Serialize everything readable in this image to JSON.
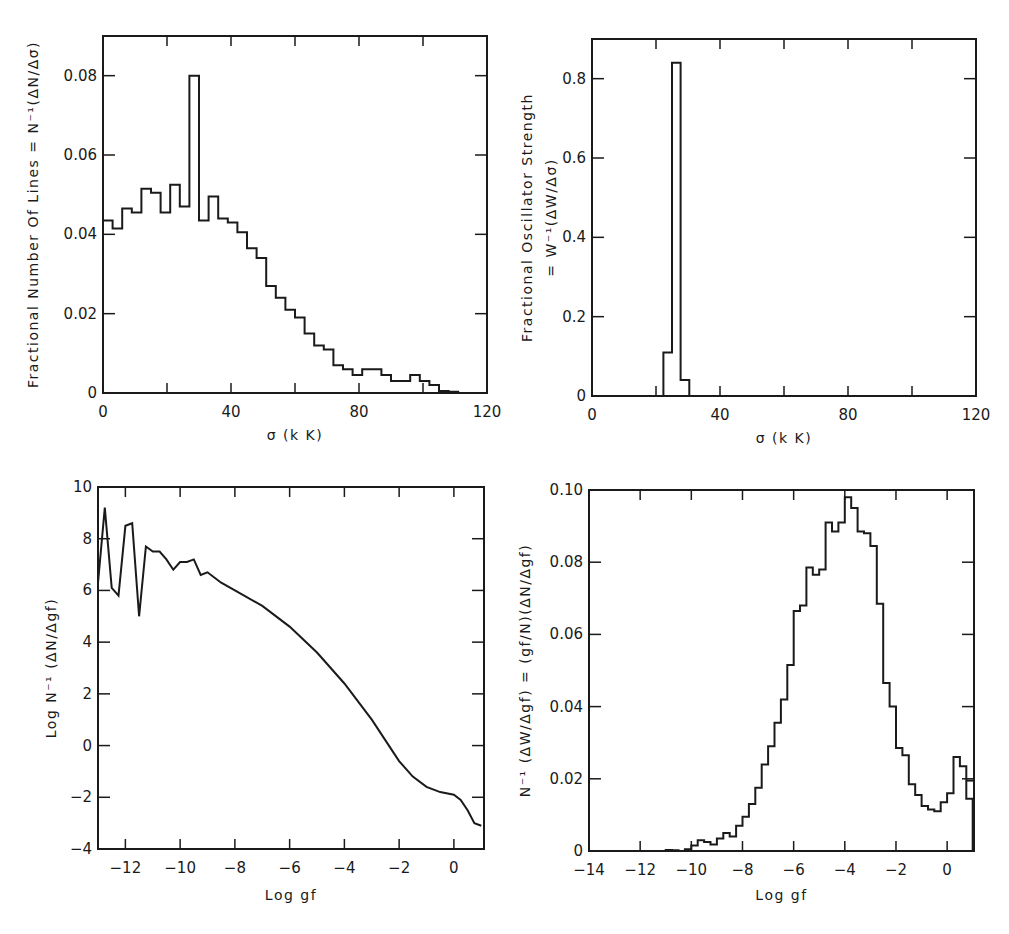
{
  "figure": {
    "panels": [
      {
        "id": "top-left",
        "xlabel": "σ (k K)",
        "ylabel": "Fractional Number Of Lines = N⁻¹(ΔN/Δσ)",
        "xticks": [
          "0",
          "40",
          "80",
          "120"
        ],
        "yticks": [
          "0",
          "0.02",
          "0.04",
          "0.06",
          "0.08"
        ]
      },
      {
        "id": "top-right",
        "xlabel": "σ (k K)",
        "ylabel_line1": "Fractional Oscillator Strength",
        "ylabel_line2": "= W⁻¹(ΔW/Δσ)",
        "xticks": [
          "0",
          "40",
          "80",
          "120"
        ],
        "yticks": [
          "0",
          "0.2",
          "0.4",
          "0.6",
          "0.8"
        ]
      },
      {
        "id": "bottom-left",
        "xlabel": "Log  gf",
        "ylabel": "Log N⁻¹ (ΔN/Δgf)",
        "xticks": [
          "-12",
          "-10",
          "-8",
          "-6",
          "-4",
          "-2",
          "0"
        ],
        "yticks": [
          "-4",
          "-2",
          "0",
          "2",
          "4",
          "6",
          "8",
          "10"
        ]
      },
      {
        "id": "bottom-right",
        "xlabel": "Log  gf",
        "ylabel": "N⁻¹ (ΔW/Δgf) = (gf/N)(ΔN/Δgf)",
        "xticks": [
          "-14",
          "-12",
          "-10",
          "-8",
          "-6",
          "-4",
          "-2",
          "0"
        ],
        "yticks": [
          "0",
          "0.02",
          "0.04",
          "0.06",
          "0.08",
          "0.10"
        ]
      }
    ]
  },
  "chart_data": [
    {
      "type": "bar",
      "style": "step-histogram",
      "title": "",
      "xlabel": "σ (k K)",
      "ylabel": "Fractional Number Of Lines = N⁻¹(ΔN/Δσ)",
      "xlim": [
        0,
        120
      ],
      "ylim": [
        0,
        0.09
      ],
      "grid": false,
      "bin_width": 3,
      "x": [
        0,
        3,
        6,
        9,
        12,
        15,
        18,
        21,
        24,
        27,
        30,
        33,
        36,
        39,
        42,
        45,
        48,
        51,
        54,
        57,
        60,
        63,
        66,
        69,
        72,
        75,
        78,
        81,
        84,
        87,
        90,
        93,
        96,
        99,
        102,
        105,
        108
      ],
      "values": [
        0.0435,
        0.0415,
        0.0465,
        0.0455,
        0.0515,
        0.0505,
        0.0455,
        0.0525,
        0.047,
        0.08,
        0.0435,
        0.0495,
        0.044,
        0.043,
        0.0405,
        0.0365,
        0.034,
        0.027,
        0.024,
        0.021,
        0.019,
        0.015,
        0.012,
        0.011,
        0.007,
        0.006,
        0.0045,
        0.006,
        0.006,
        0.0045,
        0.003,
        0.003,
        0.0045,
        0.003,
        0.002,
        0.0005,
        0.0003
      ]
    },
    {
      "type": "bar",
      "style": "step-histogram",
      "title": "",
      "xlabel": "σ (k K)",
      "ylabel": "Fractional Oscillator Strength = W⁻¹(ΔW/Δσ)",
      "xlim": [
        0,
        120
      ],
      "ylim": [
        0,
        0.9
      ],
      "grid": false,
      "bin_width": 2.7,
      "x": [
        22.3,
        25.0,
        27.7
      ],
      "values": [
        0.11,
        0.84,
        0.04
      ]
    },
    {
      "type": "line",
      "title": "",
      "xlabel": "Log  gf",
      "ylabel": "Log N⁻¹ (ΔN/Δgf)",
      "xlim": [
        -13,
        1.1
      ],
      "ylim": [
        -4,
        10
      ],
      "grid": false,
      "x": [
        -13.0,
        -12.75,
        -12.5,
        -12.25,
        -12.0,
        -11.75,
        -11.5,
        -11.25,
        -11.0,
        -10.75,
        -10.5,
        -10.25,
        -10.0,
        -9.75,
        -9.5,
        -9.25,
        -9.0,
        -8.75,
        -8.5,
        -8.0,
        -7.0,
        -6.0,
        -5.0,
        -4.0,
        -3.0,
        -2.0,
        -1.5,
        -1.0,
        -0.5,
        0.0,
        0.25,
        0.5,
        0.75,
        1.0
      ],
      "values": [
        6.3,
        9.2,
        6.1,
        5.8,
        8.5,
        8.6,
        5.0,
        7.7,
        7.5,
        7.5,
        7.2,
        6.8,
        7.1,
        7.1,
        7.2,
        6.6,
        6.7,
        6.5,
        6.3,
        6.0,
        5.4,
        4.6,
        3.6,
        2.4,
        1.0,
        -0.6,
        -1.2,
        -1.6,
        -1.8,
        -1.9,
        -2.1,
        -2.5,
        -3.0,
        -3.1
      ]
    },
    {
      "type": "bar",
      "style": "step-histogram",
      "title": "",
      "xlabel": "Log  gf",
      "ylabel": "N⁻¹ (ΔW/Δgf) = (gf/N)(ΔN/Δgf)",
      "xlim": [
        -14,
        1.05
      ],
      "ylim": [
        0,
        0.1
      ],
      "grid": false,
      "bin_width": 0.25,
      "x": [
        -11.0,
        -10.75,
        -10.5,
        -10.25,
        -10.0,
        -9.75,
        -9.5,
        -9.25,
        -9.0,
        -8.75,
        -8.5,
        -8.25,
        -8.0,
        -7.75,
        -7.5,
        -7.25,
        -7.0,
        -6.75,
        -6.5,
        -6.25,
        -6.0,
        -5.75,
        -5.5,
        -5.25,
        -5.0,
        -4.75,
        -4.5,
        -4.25,
        -4.0,
        -3.75,
        -3.5,
        -3.25,
        -3.0,
        -2.75,
        -2.5,
        -2.25,
        -2.0,
        -1.75,
        -1.5,
        -1.25,
        -1.0,
        -0.75,
        -0.5,
        -0.25,
        0.0,
        0.25,
        0.5,
        0.75
      ],
      "values": [
        0.0003,
        0.0002,
        0.0,
        0.0005,
        0.0015,
        0.003,
        0.0025,
        0.0018,
        0.0035,
        0.005,
        0.004,
        0.007,
        0.0095,
        0.013,
        0.0175,
        0.024,
        0.029,
        0.0355,
        0.042,
        0.0515,
        0.0665,
        0.068,
        0.0785,
        0.0765,
        0.078,
        0.091,
        0.0885,
        0.091,
        0.098,
        0.095,
        0.0885,
        0.088,
        0.0845,
        0.0685,
        0.0465,
        0.04,
        0.0285,
        0.0265,
        0.0185,
        0.0155,
        0.0125,
        0.0115,
        0.011,
        0.0135,
        0.016,
        0.026,
        0.0235,
        0.0145,
        0.005
      ],
      "notes": "Right-edge box at log gf ≈ 0.7–1.0 reaches ≈0.0195"
    }
  ]
}
